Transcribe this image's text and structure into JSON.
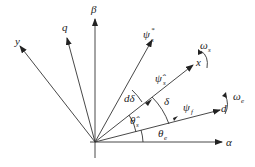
{
  "diagram": {
    "type": "vector-phasor-diagram",
    "origin": [
      95,
      142
    ],
    "labels": {
      "beta": "β",
      "alpha": "α",
      "q": "q",
      "y": "y",
      "psi_s_star": "ψ",
      "psi_s_star_sup": "*",
      "psi_s_star_sub": "s",
      "psi_s_hat": "ψ̂",
      "psi_s_hat_sub": "s",
      "x": "x",
      "omega_s": "ω",
      "omega_s_sub": "s",
      "psi_f": "ψ",
      "psi_f_sub": "f",
      "d": "d",
      "omega_e": "ω",
      "omega_e_sub": "e",
      "d_delta": "dδ",
      "delta": "δ",
      "theta_s_hat": "θ̂",
      "theta_s_sub": "s",
      "theta_e": "θ",
      "theta_e_sub": "e"
    },
    "color": "#222222"
  }
}
